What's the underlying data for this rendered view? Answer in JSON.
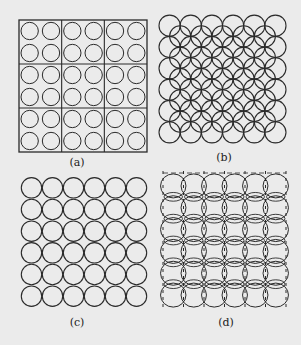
{
  "figure": {
    "background": "#ebebeb",
    "stroke_color": "#2a2a2a",
    "panels": [
      {
        "id": "a",
        "caption": "(a)",
        "description": "6x6 circles in square grid, enclosed in frame divided into 3x3 cells (2x2 circles per cell)",
        "rows": 6,
        "cols": 6,
        "grid_cells": 3,
        "box": {
          "x": 19,
          "y": 20,
          "w": 128,
          "h": 132
        },
        "caption_pos": {
          "x": 77,
          "y": 156
        }
      },
      {
        "id": "b",
        "caption": "(b)",
        "description": "6x6 overlapping circles with interstitial circles forming interlocking pattern",
        "rows": 6,
        "cols": 6,
        "box": {
          "x": 159,
          "y": 15,
          "w": 127,
          "h": 128
        },
        "caption_pos": {
          "x": 224,
          "y": 151
        }
      },
      {
        "id": "c",
        "caption": "(c)",
        "description": "6x6 tangent circles in square grid, no frame",
        "rows": 6,
        "cols": 6,
        "box": {
          "x": 21,
          "y": 177,
          "w": 126,
          "h": 130
        },
        "caption_pos": {
          "x": 77,
          "y": 316
        }
      },
      {
        "id": "d",
        "caption": "(d)",
        "description": "Lattice of lens-shaped intersecting arcs with dashed vertical lines",
        "rows": 6,
        "cols": 6,
        "box": {
          "x": 163,
          "y": 175,
          "w": 123,
          "h": 131
        },
        "caption_pos": {
          "x": 226,
          "y": 316
        }
      }
    ]
  }
}
